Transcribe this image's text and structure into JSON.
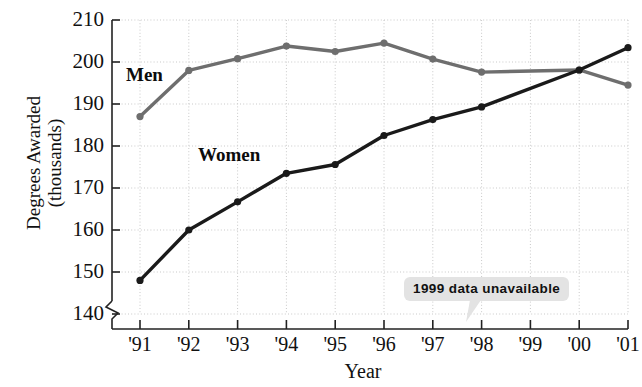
{
  "chart_data": {
    "type": "line",
    "title": "",
    "xlabel": "Year",
    "ylabel": "Degrees Awarded (thousands)",
    "ylabel_line1": "Degrees Awarded",
    "ylabel_line2": "(thousands)",
    "categories": [
      "'91",
      "'92",
      "'93",
      "'94",
      "'95",
      "'96",
      "'97",
      "'98",
      "'99",
      "'00",
      "'01"
    ],
    "x_values": [
      1991,
      1992,
      1993,
      1994,
      1995,
      1996,
      1997,
      1998,
      1999,
      2000,
      2001
    ],
    "ylim": [
      140,
      210
    ],
    "y_ticks": [
      140,
      150,
      160,
      170,
      180,
      190,
      200,
      210
    ],
    "y_axis_break": true,
    "grid": true,
    "grid_style": "dotted",
    "legend_position": "inline-labels",
    "series": [
      {
        "name": "Men",
        "color": "#6e6e6e",
        "values": [
          187,
          198,
          200.8,
          203.8,
          202.5,
          204.5,
          200.7,
          197.6,
          null,
          198.1,
          194.5
        ]
      },
      {
        "name": "Women",
        "color": "#1a1a1a",
        "values": [
          148,
          160,
          166.7,
          173.5,
          175.6,
          182.5,
          186.3,
          189.3,
          null,
          198.1,
          203.4
        ]
      }
    ],
    "annotations": [
      {
        "text": "1999 data unavailable",
        "points_to": "'99",
        "background": "#e3e3e3"
      }
    ]
  },
  "axis": {
    "x_title": "Year"
  },
  "colors": {
    "men_line": "#6e6e6e",
    "women_line": "#1a1a1a",
    "grid": "#c9c9c9",
    "axis": "#222222",
    "callout_bg": "#e3e3e3"
  }
}
